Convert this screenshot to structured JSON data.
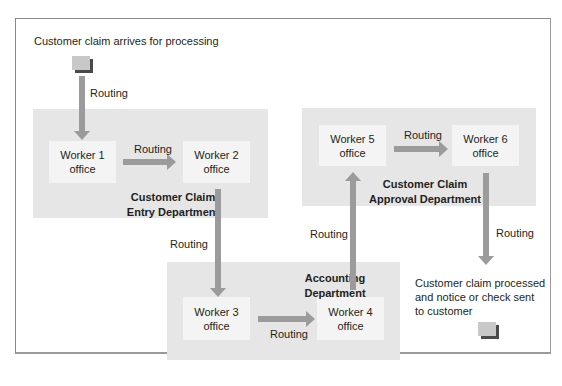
{
  "diagram": {
    "start_label": "Customer claim arrives for processing",
    "end_label_lines": [
      "Customer claim processed",
      "and notice or check sent",
      "to customer"
    ],
    "routing_label": "Routing",
    "departments": [
      {
        "id": "entry",
        "label_lines": [
          "Customer Claim",
          "Entry Department"
        ]
      },
      {
        "id": "approval",
        "label_lines": [
          "Customer Claim",
          "Approval Department"
        ]
      },
      {
        "id": "accounting",
        "label_lines": [
          "Accounting",
          "Department"
        ]
      }
    ],
    "offices": [
      {
        "id": "w1",
        "line1": "Worker 1",
        "line2": "office"
      },
      {
        "id": "w2",
        "line1": "Worker 2",
        "line2": "office"
      },
      {
        "id": "w3",
        "line1": "Worker 3",
        "line2": "office"
      },
      {
        "id": "w4",
        "line1": "Worker 4",
        "line2": "office"
      },
      {
        "id": "w5",
        "line1": "Worker 5",
        "line2": "office"
      },
      {
        "id": "w6",
        "line1": "Worker 6",
        "line2": "office"
      }
    ],
    "routing_labels": [
      "Routing",
      "Routing",
      "Routing",
      "Routing",
      "Routing",
      "Routing",
      "Routing"
    ],
    "colors": {
      "department_bg": "#e6e6e6",
      "office_bg": "#f4f4f4",
      "arrow": "#9b9b9b",
      "doc": "#c8c8c8",
      "doc_shadow": "#4a4a4a"
    }
  }
}
